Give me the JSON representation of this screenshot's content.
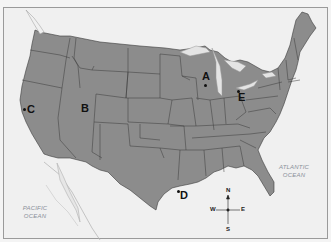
{
  "map": {
    "title": "United States outline map",
    "colors": {
      "land": "#8c8c8c",
      "water": "#f0f0f0",
      "lakes": "#e4e4e4",
      "borders": "#3a3a3a",
      "mexico": "#ededed"
    },
    "markers": [
      {
        "id": "A",
        "label": "A"
      },
      {
        "id": "B",
        "label": "B"
      },
      {
        "id": "C",
        "label": "C"
      },
      {
        "id": "D",
        "label": "D"
      },
      {
        "id": "E",
        "label": "E"
      }
    ],
    "oceans": {
      "pacific": [
        "PACIFIC",
        "OCEAN"
      ],
      "atlantic": [
        "ATLANTIC",
        "OCEAN"
      ]
    },
    "compass": {
      "n": "N",
      "s": "S",
      "e": "E",
      "w": "W"
    }
  }
}
